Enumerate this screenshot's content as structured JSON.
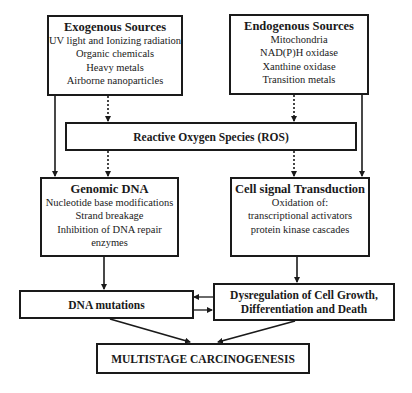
{
  "diagram": {
    "exogenous": {
      "title": "Exogenous Sources",
      "items": [
        "UV light and Ionizing radiation",
        "Organic chemicals",
        "Heavy metals",
        "Airborne nanoparticles"
      ]
    },
    "endogenous": {
      "title": "Endogenous Sources",
      "items": [
        "Mitochondria",
        "NAD(P)H oxidase",
        "Xanthine oxidase",
        "Transition metals"
      ]
    },
    "ros": {
      "title": "Reactive Oxygen Species (ROS)"
    },
    "genomic_dna": {
      "title": "Genomic DNA",
      "items": [
        "Nucleotide base modifications",
        "Strand breakage",
        "Inhibition of DNA repair",
        "enzymes"
      ]
    },
    "cell_signal": {
      "title": "Cell signal Transduction",
      "items": [
        "Oxidation of:",
        "transcriptional activators",
        "protein kinase cascades"
      ]
    },
    "dna_mutations": {
      "title": "DNA mutations"
    },
    "dysregulation": {
      "lines": [
        "Dysregulation of Cell Growth,",
        "Differentiation and Death"
      ]
    },
    "carcinogenesis": {
      "title": "MULTISTAGE CARCINOGENESIS"
    },
    "colors": {
      "stroke": "#1a1a1a",
      "background": "#ffffff"
    }
  }
}
